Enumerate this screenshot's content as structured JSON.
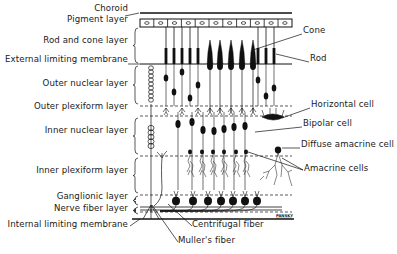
{
  "diagram": {
    "colors": {
      "ink": "#111111",
      "background": "#ffffff"
    },
    "left_labels": [
      {
        "id": "choroid",
        "text": "Choroid",
        "y": 8
      },
      {
        "id": "pigment-layer",
        "text": "Pigment layer",
        "y": 19
      },
      {
        "id": "rod-and-cone-layer",
        "text": "Rod and cone layer",
        "y": 40
      },
      {
        "id": "external-limiting-membrane",
        "text": "External limiting membrane",
        "y": 59
      },
      {
        "id": "outer-nuclear-layer",
        "text": "Outer nuclear layer",
        "y": 83
      },
      {
        "id": "outer-plexiform-layer",
        "text": "Outer plexiform layer",
        "y": 106
      },
      {
        "id": "inner-nuclear-layer",
        "text": "Inner nuclear layer",
        "y": 130
      },
      {
        "id": "inner-plexiform-layer",
        "text": "Inner plexiform layer",
        "y": 170
      },
      {
        "id": "ganglionic-layer",
        "text": "Ganglionic layer",
        "y": 196
      },
      {
        "id": "nerve-fiber-layer",
        "text": "Nerve fiber layer",
        "y": 208
      },
      {
        "id": "internal-limiting-membrane",
        "text": "Internal limiting membrane",
        "y": 224
      }
    ],
    "right_labels": [
      {
        "id": "cone",
        "text": "Cone",
        "x": 303,
        "y": 30
      },
      {
        "id": "rod",
        "text": "Rod",
        "x": 310,
        "y": 58
      },
      {
        "id": "horizontal-cell",
        "text": "Horizontal cell",
        "x": 311,
        "y": 104
      },
      {
        "id": "bipolar-cell",
        "text": "Bipolar cell",
        "x": 303,
        "y": 123
      },
      {
        "id": "diffuse-amacrine-cell",
        "text": "Diffuse amacrine cell",
        "x": 301,
        "y": 144
      },
      {
        "id": "amacrine-cells",
        "text": "Amacrine cells",
        "x": 304,
        "y": 168
      }
    ],
    "bottom_labels": [
      {
        "id": "centrifugal-fiber",
        "text": "Centrifugal fiber",
        "x": 192,
        "y": 224
      },
      {
        "id": "mullers-fiber",
        "text": "Muller's fiber",
        "x": 178,
        "y": 240
      }
    ],
    "signature": "PANSKY"
  }
}
